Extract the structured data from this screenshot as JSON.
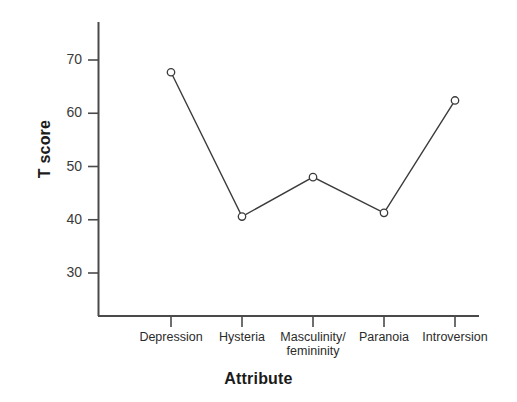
{
  "chart_data": {
    "type": "line",
    "title": "",
    "xlabel": "Attribute",
    "ylabel": "T score",
    "categories": [
      "Depression",
      "Hysteria",
      "Masculinity/\nfemininity",
      "Paranoia",
      "Introversion"
    ],
    "values": [
      67.7,
      40.6,
      48.0,
      41.3,
      62.4
    ],
    "series": [
      {
        "name": "T score profile",
        "values": [
          67.7,
          40.6,
          48.0,
          41.3,
          62.4
        ]
      }
    ],
    "ylim": [
      22,
      76
    ],
    "yticks": [
      30,
      40,
      50,
      60,
      70
    ],
    "ytick_labels": [
      "30",
      "40",
      "50",
      "60",
      "70"
    ],
    "grid": false,
    "legend": false,
    "legend_position": "none",
    "marker": "open-circle",
    "line_color": "#3b3b3b",
    "marker_edge_color": "#3b3b3b",
    "marker_face_color": "#ffffff",
    "axis_color": "#4a4a4a",
    "background_color": "#ffffff"
  },
  "axes": {
    "y_title": "T score",
    "x_title": "Attribute"
  },
  "ytick_labels": [
    "70",
    "60",
    "50",
    "40",
    "30"
  ],
  "xtick_labels": [
    "Depression",
    "Hysteria",
    "Masculinity/\nfemininity",
    "Paranoia",
    "Introversion"
  ]
}
